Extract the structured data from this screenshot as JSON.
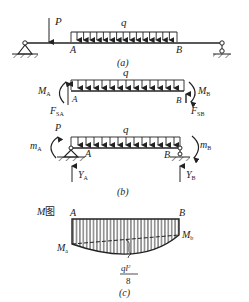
{
  "figure_a": {
    "caption": "(a)",
    "point_load": "P",
    "distributed_load": "q",
    "point_A": "A",
    "point_B": "B"
  },
  "figure_b": {
    "caption": "(b)",
    "free_body": {
      "distributed_load": "q",
      "moment_A": "M",
      "moment_A_sub": "A",
      "moment_B": "M",
      "moment_B_sub": "B",
      "shear_A": "F",
      "shear_A_sub": "SA",
      "shear_B": "F",
      "shear_B_sub": "SB",
      "point_A": "A",
      "point_B": "B"
    },
    "simply_supported": {
      "point_load": "P",
      "distributed_load": "q",
      "moment_A": "m",
      "moment_A_sub": "A",
      "moment_B": "m",
      "moment_B_sub": "B",
      "reaction_A": "Y",
      "reaction_A_sub": "A",
      "reaction_B": "Y",
      "reaction_B_sub": "B",
      "point_A": "A",
      "point_B": "B"
    }
  },
  "figure_c": {
    "caption": "(c)",
    "title_italic": "M",
    "title_suffix": "图",
    "point_A": "A",
    "point_B": "B",
    "end_moment_left": "M",
    "end_moment_left_sub": "a",
    "end_moment_right": "M",
    "end_moment_right_sub": "b",
    "midspan_numerator": "ql",
    "midspan_exponent": "2",
    "midspan_denominator": "8"
  }
}
